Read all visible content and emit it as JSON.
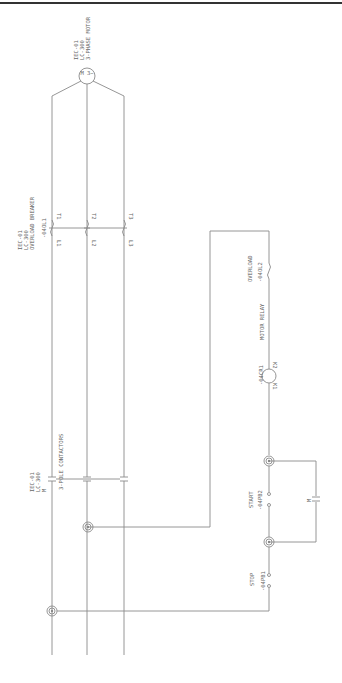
{
  "diagram": {
    "title_bar_color": "#333333",
    "wire_color": "#8a8a8a",
    "motor": {
      "tag": "IEC-01",
      "code": "LC-300",
      "label": "3-PHASE MOTOR",
      "symbol": "M 3~"
    },
    "breaker": {
      "tag": "IEC-01",
      "code": "LC-300",
      "label": "OVERLOAD BREAKER",
      "device": "-04OL1",
      "terminals_top": [
        "T1",
        "T2",
        "T3"
      ],
      "terminals_bottom": [
        "L1",
        "L2",
        "L3"
      ]
    },
    "contactor": {
      "tag": "IEC-01",
      "code": "LC-300",
      "symbol": "M",
      "label": "3-POLE CONTACTORS"
    },
    "control": {
      "overload": {
        "label": "OVERLOAD",
        "device": "-04OL2"
      },
      "relay": {
        "label": "MOTOR RELAY",
        "device": "-04CR1",
        "terminal_a": "K1",
        "terminal_b": "K2"
      },
      "start": {
        "label": "START",
        "device": "-04PB2"
      },
      "stop": {
        "label": "STOP",
        "device": "-04PB1"
      },
      "seal_in": {
        "symbol": "M"
      }
    }
  }
}
